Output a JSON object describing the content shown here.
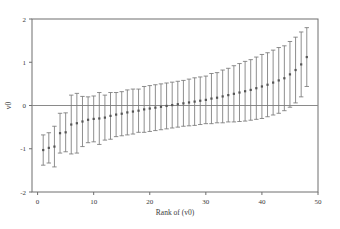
{
  "chart_data": {
    "type": "scatter",
    "title": "",
    "subtitle": "",
    "xlabel": "Rank of (v0)",
    "ylabel": "v0",
    "xlim": [
      -1,
      50
    ],
    "ylim": [
      -2,
      2
    ],
    "xticks": [
      0,
      10,
      20,
      30,
      40,
      50
    ],
    "xticklabels": [
      "0",
      "10",
      "20",
      "30",
      "40",
      "50"
    ],
    "yticks": [
      -2,
      -1,
      0,
      1,
      2
    ],
    "yticklabels": [
      "-2",
      "-1",
      "0",
      "1",
      "2"
    ],
    "grid": false,
    "legend": null,
    "zero_reference_line": 0,
    "marker": "point",
    "error_bar_style": "capped-vertical",
    "series": [
      {
        "name": "v0",
        "x": [
          1,
          2,
          3,
          4,
          5,
          6,
          7,
          8,
          9,
          10,
          11,
          12,
          13,
          14,
          15,
          16,
          17,
          18,
          19,
          20,
          21,
          22,
          23,
          24,
          25,
          26,
          27,
          28,
          29,
          30,
          31,
          32,
          33,
          34,
          35,
          36,
          37,
          38,
          39,
          40,
          41,
          42,
          43,
          44,
          45,
          46,
          47,
          48
        ],
        "values": [
          -1.03,
          -0.98,
          -0.95,
          -0.64,
          -0.62,
          -0.44,
          -0.41,
          -0.37,
          -0.33,
          -0.31,
          -0.3,
          -0.28,
          -0.24,
          -0.21,
          -0.19,
          -0.16,
          -0.14,
          -0.12,
          -0.09,
          -0.07,
          -0.05,
          -0.03,
          -0.01,
          0.01,
          0.03,
          0.05,
          0.07,
          0.09,
          0.11,
          0.13,
          0.16,
          0.18,
          0.21,
          0.24,
          0.27,
          0.3,
          0.33,
          0.36,
          0.4,
          0.44,
          0.48,
          0.53,
          0.58,
          0.63,
          0.72,
          0.82,
          0.95,
          1.12
        ],
        "err_low": [
          -1.38,
          -1.33,
          -1.42,
          -1.1,
          -1.07,
          -1.12,
          -1.1,
          -0.95,
          -0.86,
          -0.84,
          -0.9,
          -0.8,
          -0.78,
          -0.72,
          -0.7,
          -0.68,
          -0.66,
          -0.62,
          -0.62,
          -0.6,
          -0.58,
          -0.56,
          -0.54,
          -0.52,
          -0.5,
          -0.48,
          -0.47,
          -0.46,
          -0.44,
          -0.42,
          -0.42,
          -0.4,
          -0.4,
          -0.38,
          -0.38,
          -0.37,
          -0.36,
          -0.34,
          -0.32,
          -0.3,
          -0.26,
          -0.22,
          -0.18,
          -0.12,
          -0.04,
          0.06,
          0.2,
          0.44
        ],
        "err_high": [
          -0.68,
          -0.63,
          -0.48,
          -0.18,
          -0.17,
          0.24,
          0.28,
          0.21,
          0.2,
          0.22,
          0.3,
          0.24,
          0.3,
          0.3,
          0.32,
          0.36,
          0.38,
          0.38,
          0.44,
          0.46,
          0.48,
          0.5,
          0.52,
          0.54,
          0.56,
          0.58,
          0.61,
          0.64,
          0.66,
          0.68,
          0.74,
          0.76,
          0.82,
          0.86,
          0.92,
          0.97,
          1.02,
          1.06,
          1.12,
          1.18,
          1.22,
          1.28,
          1.34,
          1.38,
          1.48,
          1.58,
          1.7,
          1.8
        ]
      }
    ]
  },
  "colors": {
    "frame": "#6e6e6e",
    "zero_line": "#8a8a8a",
    "error_bar": "#7a7a7a",
    "marker": "#555555",
    "text": "#3a3a3a",
    "background": "#ffffff"
  }
}
